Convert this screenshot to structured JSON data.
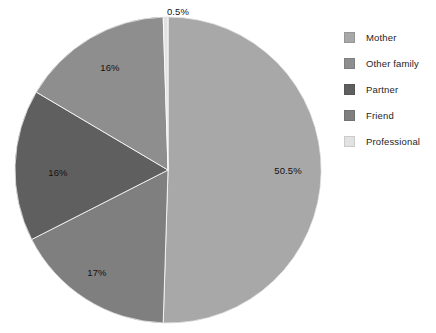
{
  "chart_data": {
    "type": "pie",
    "title": "",
    "subtitle": "",
    "xlabel": "",
    "ylabel": "",
    "grid": false,
    "legend_position": "right",
    "start_angle_deg": 0,
    "direction": "clockwise",
    "categories": [
      "Mother",
      "Other family",
      "Partner",
      "Friend",
      "Professional"
    ],
    "values": [
      50.5,
      16,
      16,
      17,
      0.5
    ],
    "value_unit": "%",
    "data_labels": [
      "50.5%",
      "16%",
      "16%",
      "17%",
      "0.5%"
    ],
    "colors": [
      "#a8a8a8",
      "#8e8e8e",
      "#5f5f5f",
      "#7f7f7f",
      "#e2e2e2"
    ],
    "slices": [
      {
        "name": "Mother",
        "value": 50.5,
        "label": "50.5%",
        "color": "#a8a8a8",
        "start_deg": 0,
        "end_deg": 181.8,
        "label_x": 288,
        "label_y": 170,
        "label_on_dark": false
      },
      {
        "name": "Friend",
        "value": 17,
        "label": "17%",
        "color": "#7f7f7f",
        "start_deg": 181.8,
        "end_deg": 243.0,
        "label_x": 97,
        "label_y": 272,
        "label_on_dark": false
      },
      {
        "name": "Partner",
        "value": 16,
        "label": "16%",
        "color": "#5f5f5f",
        "start_deg": 243.0,
        "end_deg": 300.6,
        "label_x": 58,
        "label_y": 172,
        "label_on_dark": true
      },
      {
        "name": "Other family",
        "value": 16,
        "label": "16%",
        "color": "#8e8e8e",
        "start_deg": 300.6,
        "end_deg": 358.2,
        "label_x": 110,
        "label_y": 67,
        "label_on_dark": false
      },
      {
        "name": "Professional",
        "value": 0.5,
        "label": "0.5%",
        "color": "#e2e2e2",
        "start_deg": 358.2,
        "end_deg": 360,
        "label_x": 178,
        "label_y": 11,
        "label_on_dark": false
      }
    ],
    "geometry": {
      "center_x": 168,
      "center_y": 170,
      "radius": 153
    }
  },
  "legend": {
    "items": [
      {
        "label": "Mother",
        "color": "#a8a8a8"
      },
      {
        "label": "Other family",
        "color": "#8e8e8e"
      },
      {
        "label": "Partner",
        "color": "#5f5f5f"
      },
      {
        "label": "Friend",
        "color": "#7f7f7f"
      },
      {
        "label": "Professional",
        "color": "#e2e2e2"
      }
    ]
  }
}
